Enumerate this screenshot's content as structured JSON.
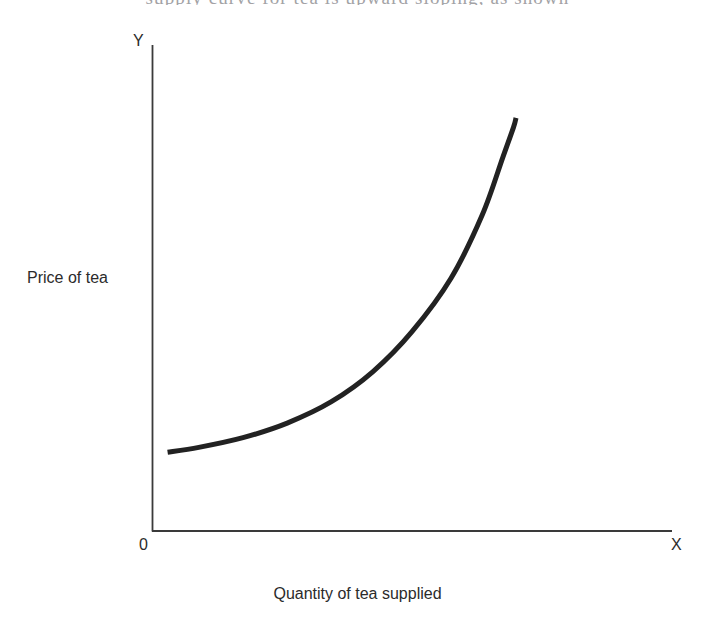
{
  "figure": {
    "page_text_fragment": "supply curve for tea is upward sloping, as shown",
    "background_color": "#ffffff"
  },
  "axes": {
    "y_tip_label": "Y",
    "x_tip_label": "X",
    "origin_label": "0",
    "y_title": "Price of tea",
    "x_title": "Quantity of tea supplied",
    "line_color": "#3a3a3a"
  },
  "chart_data": {
    "type": "line",
    "title": "",
    "subtitle": "",
    "xlabel": "Quantity of tea supplied",
    "ylabel": "Price of tea",
    "xlim": [
      0,
      10
    ],
    "ylim": [
      0,
      10
    ],
    "grid": false,
    "legend": "none",
    "axis_tick_labels": {
      "x": [
        "0",
        "X"
      ],
      "y": [
        "Y"
      ]
    },
    "annotations": [
      {
        "text": "Y",
        "position": "y-axis-top"
      },
      {
        "text": "X",
        "position": "x-axis-right-end"
      },
      {
        "text": "0",
        "position": "origin"
      }
    ],
    "series": [
      {
        "name": "Supply curve",
        "color": "#222222",
        "line_width": 5,
        "x": [
          0.3,
          0.9,
          1.75,
          2.6,
          3.45,
          4.25,
          5.0,
          5.75,
          6.35,
          6.75,
          6.95,
          7.0
        ],
        "y": [
          1.62,
          1.72,
          1.92,
          2.22,
          2.66,
          3.28,
          4.1,
          5.2,
          6.5,
          7.7,
          8.3,
          8.5
        ]
      }
    ]
  },
  "geometry": {
    "y_axis_x": 152,
    "x_axis_y": 531,
    "y_axis_top": 45,
    "x_axis_right": 672,
    "curve_path": "M 168,452 C 230,444 300,430 362,410 C 420,390 460,330 482,240 C 495,186 499,148 500,118"
  }
}
